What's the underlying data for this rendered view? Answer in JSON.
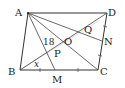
{
  "diagram": {
    "type": "geometry-parallelogram",
    "colors": {
      "line": "#333333",
      "faint": "#cccccc",
      "text": "#222222"
    },
    "points": {
      "A": {
        "label": "A",
        "x": 28,
        "y": 13
      },
      "D": {
        "label": "D",
        "x": 107,
        "y": 13
      },
      "B": {
        "label": "B",
        "x": 20,
        "y": 70
      },
      "C": {
        "label": "C",
        "x": 98,
        "y": 70
      },
      "M": {
        "label": "M",
        "x": 55,
        "y": 70
      },
      "N": {
        "label": "N",
        "x": 102,
        "y": 41
      },
      "O": {
        "label": "O",
        "x": 63,
        "y": 41
      },
      "P": {
        "label": "P",
        "x": 50,
        "y": 50
      },
      "Q": {
        "label": "Q",
        "x": 88,
        "y": 25
      }
    },
    "segments": [
      "AB",
      "BC",
      "CD",
      "DA",
      "AC",
      "BD",
      "AM",
      "AN"
    ],
    "angle_labels": {
      "angle_APB": "18",
      "angle_DBC": "x"
    },
    "tick_marks": [
      "BM",
      "MC",
      "CN",
      "ND"
    ]
  }
}
